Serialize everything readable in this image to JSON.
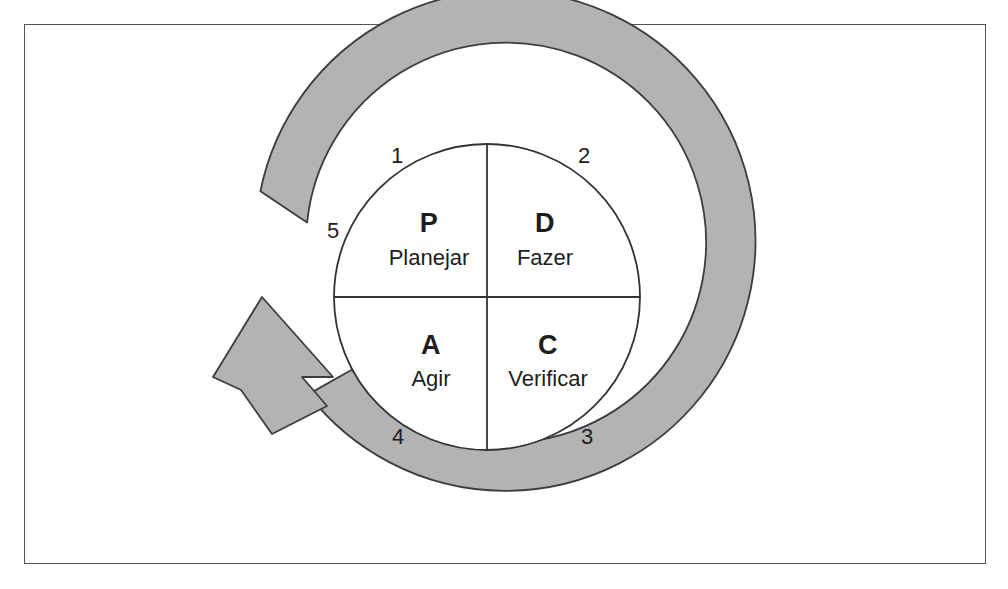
{
  "figure": {
    "type": "pdca-cycle-diagram",
    "colors": {
      "ring_fill": "#b3b3b3",
      "ring_stroke": "#3d3d3f",
      "circle_fill": "#ffffff",
      "circle_stroke": "#333335",
      "frame_stroke": "#545456",
      "background": "#ffffff",
      "text": "#1d1d1d"
    }
  },
  "quadrants": [
    {
      "letter": "P",
      "word": "Planejar",
      "position": "top-left"
    },
    {
      "letter": "D",
      "word": "Fazer",
      "position": "top-right"
    },
    {
      "letter": "A",
      "word": "Agir",
      "position": "bottom-left"
    },
    {
      "letter": "C",
      "word": "Verificar",
      "position": "bottom-right"
    }
  ],
  "step_numbers": [
    {
      "value": "1",
      "position": "top-left-outer"
    },
    {
      "value": "2",
      "position": "top-right-outer"
    },
    {
      "value": "3",
      "position": "bottom-right-outer"
    },
    {
      "value": "4",
      "position": "bottom-left-outer"
    },
    {
      "value": "5",
      "position": "left-outer"
    }
  ],
  "arrow": {
    "direction": "clockwise",
    "head": "upper-left"
  }
}
